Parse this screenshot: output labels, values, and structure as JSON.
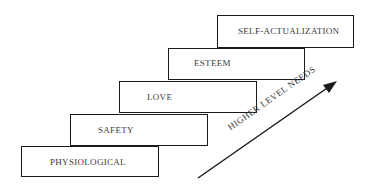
{
  "diagram": {
    "type": "staircase-hierarchy",
    "steps": [
      {
        "level": 1,
        "label": "PHYSIOLOGICAL"
      },
      {
        "level": 2,
        "label": "SAFETY"
      },
      {
        "level": 3,
        "label": "LOVE"
      },
      {
        "level": 4,
        "label": "ESTEEM"
      },
      {
        "level": 5,
        "label": "SELF-ACTUALIZATION"
      }
    ],
    "arrow": {
      "label": "HIGHER LEVEL NEEDS",
      "direction": "up-right"
    }
  },
  "colors": {
    "line": "#1a1a1a",
    "text": "#3a3a3a",
    "background": "#ffffff"
  }
}
